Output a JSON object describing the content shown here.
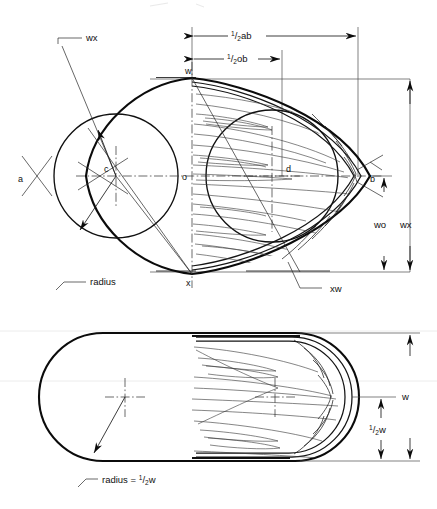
{
  "figure": {
    "title_fragment": "",
    "top_view": {
      "name": "end-elevation-pointed-oval",
      "dimensions": [
        {
          "id": "half-ab",
          "label_whole": "1/2ab",
          "numerator": "1",
          "denominator": "2",
          "suffix": "ab"
        },
        {
          "id": "half-ob",
          "label_whole": "1/2ob",
          "numerator": "1",
          "denominator": "2",
          "suffix": "ob"
        },
        {
          "id": "wo",
          "label": "wo"
        },
        {
          "id": "wx",
          "label": "wx"
        }
      ],
      "point_labels": [
        {
          "id": "w",
          "label": "w"
        },
        {
          "id": "a",
          "label": "a"
        },
        {
          "id": "b",
          "label": "b"
        },
        {
          "id": "c",
          "label": "c"
        },
        {
          "id": "d",
          "label": "d"
        },
        {
          "id": "o",
          "label": "o"
        },
        {
          "id": "x",
          "label": "x"
        }
      ],
      "leader_labels": [
        {
          "id": "wx-upper-left",
          "label": "wx"
        },
        {
          "id": "radius",
          "label": "radius"
        },
        {
          "id": "xw",
          "label": "xw"
        }
      ]
    },
    "bottom_view": {
      "name": "plan-view-obround",
      "dimensions": [
        {
          "id": "w",
          "label": "w"
        },
        {
          "id": "half-w",
          "label_whole": "1/2w",
          "numerator": "1",
          "denominator": "2",
          "suffix": "w"
        }
      ],
      "leader_labels": [
        {
          "id": "radius-half-w",
          "prefix": "radius = ",
          "numerator": "1",
          "denominator": "2",
          "suffix": "w"
        }
      ]
    },
    "colors": {
      "ink": "#0b0b0b",
      "construction": "#2b2b2b",
      "grain": "#3a3a3a",
      "paper": "#ffffff"
    }
  }
}
